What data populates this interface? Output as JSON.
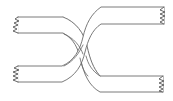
{
  "figure": {
    "title": "Two flat bands crossing over one another",
    "background_color": "#ffffff",
    "stroke_color": "#6b6b6b",
    "hidden_edge_color": "#a9a9a9",
    "canvas": {
      "width": 173,
      "height": 101
    },
    "parts": {
      "upper_left_end_label": "upper left torn end",
      "lower_left_end_label": "lower left torn end",
      "upper_right_end_label": "upper right torn end",
      "lower_right_end_label": "lower right torn end",
      "crossing_label": "central crossing region",
      "hidden_edge_label": "hidden edge shown dashed"
    },
    "bands": [
      {
        "name": "band-a",
        "from": "lower left",
        "to": "upper right",
        "over_under": "over"
      },
      {
        "name": "band-b",
        "from": "upper left",
        "to": "lower right",
        "over_under": "under"
      }
    ],
    "band_geometry": {
      "upper_left_top_y": 17,
      "upper_left_bottom_y": 33,
      "lower_left_top_y": 66,
      "lower_left_bottom_y": 82,
      "upper_right_top_y": 7,
      "upper_right_bottom_y": 24,
      "lower_right_top_y": 76,
      "lower_right_bottom_y": 92
    }
  }
}
